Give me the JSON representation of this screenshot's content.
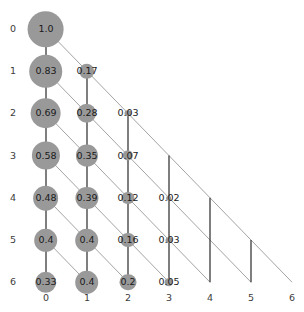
{
  "figure": {
    "title": "",
    "width": 304,
    "height": 312,
    "background": "#ffffff"
  },
  "chart_data": {
    "type": "scatter",
    "title": "",
    "xlabel": "",
    "ylabel": "",
    "x_ticks": [
      "0",
      "1",
      "2",
      "3",
      "4",
      "5",
      "6"
    ],
    "y_ticks": [
      "0",
      "1",
      "2",
      "3",
      "4",
      "5",
      "6"
    ],
    "xlim": [
      0,
      6
    ],
    "ylim": [
      0,
      6
    ],
    "grid": false,
    "legend": null,
    "node_color": "#999999",
    "vertical_edge_color": "#3a3a3a",
    "diagonal_edge_color": "#8c8c8c",
    "label_color": "#1a1a1a",
    "axis_label_color": "#3c3c3c",
    "nodes": [
      {
        "row": 0,
        "col": 0,
        "value": 1.0,
        "label": "1.0",
        "radius": 18.0
      },
      {
        "row": 1,
        "col": 0,
        "value": 0.83,
        "label": "0.83",
        "radius": 16.4
      },
      {
        "row": 1,
        "col": 1,
        "value": 0.17,
        "label": "0.17",
        "radius": 7.4
      },
      {
        "row": 2,
        "col": 0,
        "value": 0.69,
        "label": "0.69",
        "radius": 15.0
      },
      {
        "row": 2,
        "col": 1,
        "value": 0.28,
        "label": "0.28",
        "radius": 9.5
      },
      {
        "row": 2,
        "col": 2,
        "value": 0.03,
        "label": "0.03",
        "radius": 3.1
      },
      {
        "row": 3,
        "col": 0,
        "value": 0.58,
        "label": "0.58",
        "radius": 13.7
      },
      {
        "row": 3,
        "col": 1,
        "value": 0.35,
        "label": "0.35",
        "radius": 10.7
      },
      {
        "row": 3,
        "col": 2,
        "value": 0.07,
        "label": "0.07",
        "radius": 4.8
      },
      {
        "row": 3,
        "col": 3,
        "value": null,
        "label": "",
        "radius": 0
      },
      {
        "row": 4,
        "col": 0,
        "value": 0.48,
        "label": "0.48",
        "radius": 12.5
      },
      {
        "row": 4,
        "col": 1,
        "value": 0.39,
        "label": "0.39",
        "radius": 11.2
      },
      {
        "row": 4,
        "col": 2,
        "value": 0.12,
        "label": "0.12",
        "radius": 6.2
      },
      {
        "row": 4,
        "col": 3,
        "value": 0.02,
        "label": "0.02",
        "radius": 2.5
      },
      {
        "row": 4,
        "col": 4,
        "value": null,
        "label": "",
        "radius": 0
      },
      {
        "row": 5,
        "col": 0,
        "value": 0.4,
        "label": "0.4",
        "radius": 11.4
      },
      {
        "row": 5,
        "col": 1,
        "value": 0.4,
        "label": "0.4",
        "radius": 11.4
      },
      {
        "row": 5,
        "col": 2,
        "value": 0.16,
        "label": "0.16",
        "radius": 7.2
      },
      {
        "row": 5,
        "col": 3,
        "value": 0.03,
        "label": "0.03",
        "radius": 3.1
      },
      {
        "row": 5,
        "col": 4,
        "value": null,
        "label": "",
        "radius": 0
      },
      {
        "row": 5,
        "col": 5,
        "value": null,
        "label": "",
        "radius": 0
      },
      {
        "row": 6,
        "col": 0,
        "value": 0.33,
        "label": "0.33",
        "radius": 10.4
      },
      {
        "row": 6,
        "col": 1,
        "value": 0.4,
        "label": "0.4",
        "radius": 11.4
      },
      {
        "row": 6,
        "col": 2,
        "value": 0.2,
        "label": "0.2",
        "radius": 8.1
      },
      {
        "row": 6,
        "col": 3,
        "value": 0.05,
        "label": "0.05",
        "radius": 4.0
      },
      {
        "row": 6,
        "col": 4,
        "value": null,
        "label": "",
        "radius": 0
      },
      {
        "row": 6,
        "col": 5,
        "value": null,
        "label": "",
        "radius": 0
      },
      {
        "row": 6,
        "col": 6,
        "value": null,
        "label": "",
        "radius": 0
      }
    ],
    "vertical_edges": [
      {
        "col": 0,
        "from_row": 0,
        "to_row": 1
      },
      {
        "col": 0,
        "from_row": 1,
        "to_row": 2
      },
      {
        "col": 0,
        "from_row": 2,
        "to_row": 3
      },
      {
        "col": 0,
        "from_row": 3,
        "to_row": 4
      },
      {
        "col": 0,
        "from_row": 4,
        "to_row": 5
      },
      {
        "col": 0,
        "from_row": 5,
        "to_row": 6
      },
      {
        "col": 1,
        "from_row": 1,
        "to_row": 2
      },
      {
        "col": 1,
        "from_row": 2,
        "to_row": 3
      },
      {
        "col": 1,
        "from_row": 3,
        "to_row": 4
      },
      {
        "col": 1,
        "from_row": 4,
        "to_row": 5
      },
      {
        "col": 1,
        "from_row": 5,
        "to_row": 6
      },
      {
        "col": 2,
        "from_row": 2,
        "to_row": 3
      },
      {
        "col": 2,
        "from_row": 3,
        "to_row": 4
      },
      {
        "col": 2,
        "from_row": 4,
        "to_row": 5
      },
      {
        "col": 2,
        "from_row": 5,
        "to_row": 6
      },
      {
        "col": 3,
        "from_row": 3,
        "to_row": 4
      },
      {
        "col": 3,
        "from_row": 4,
        "to_row": 5
      },
      {
        "col": 3,
        "from_row": 5,
        "to_row": 6
      },
      {
        "col": 4,
        "from_row": 4,
        "to_row": 5
      },
      {
        "col": 4,
        "from_row": 5,
        "to_row": 6
      },
      {
        "col": 5,
        "from_row": 5,
        "to_row": 6
      }
    ],
    "diagonal_edges": [
      {
        "from_row": 0,
        "from_col": 0,
        "to_row": 1,
        "to_col": 1
      },
      {
        "from_row": 1,
        "from_col": 1,
        "to_row": 2,
        "to_col": 2
      },
      {
        "from_row": 2,
        "from_col": 2,
        "to_row": 3,
        "to_col": 3
      },
      {
        "from_row": 3,
        "from_col": 3,
        "to_row": 4,
        "to_col": 4
      },
      {
        "from_row": 4,
        "from_col": 4,
        "to_row": 5,
        "to_col": 5
      },
      {
        "from_row": 5,
        "from_col": 5,
        "to_row": 6,
        "to_col": 6
      },
      {
        "from_row": 1,
        "from_col": 0,
        "to_row": 2,
        "to_col": 1
      },
      {
        "from_row": 2,
        "from_col": 1,
        "to_row": 3,
        "to_col": 2
      },
      {
        "from_row": 3,
        "from_col": 2,
        "to_row": 4,
        "to_col": 3
      },
      {
        "from_row": 4,
        "from_col": 3,
        "to_row": 5,
        "to_col": 4
      },
      {
        "from_row": 5,
        "from_col": 4,
        "to_row": 6,
        "to_col": 5
      },
      {
        "from_row": 2,
        "from_col": 0,
        "to_row": 3,
        "to_col": 1
      },
      {
        "from_row": 3,
        "from_col": 1,
        "to_row": 4,
        "to_col": 2
      },
      {
        "from_row": 4,
        "from_col": 2,
        "to_row": 5,
        "to_col": 3
      },
      {
        "from_row": 5,
        "from_col": 3,
        "to_row": 6,
        "to_col": 4
      },
      {
        "from_row": 3,
        "from_col": 0,
        "to_row": 4,
        "to_col": 1
      },
      {
        "from_row": 4,
        "from_col": 1,
        "to_row": 5,
        "to_col": 2
      },
      {
        "from_row": 5,
        "from_col": 2,
        "to_row": 6,
        "to_col": 3
      },
      {
        "from_row": 4,
        "from_col": 0,
        "to_row": 5,
        "to_col": 1
      },
      {
        "from_row": 5,
        "from_col": 1,
        "to_row": 6,
        "to_col": 2
      },
      {
        "from_row": 5,
        "from_col": 0,
        "to_row": 6,
        "to_col": 1
      }
    ],
    "geometry": {
      "origin_x": 46,
      "origin_y": 29,
      "col_step": 41,
      "row_step": 42.2,
      "x_axis_y": 298,
      "y_axis_x": 13
    }
  }
}
